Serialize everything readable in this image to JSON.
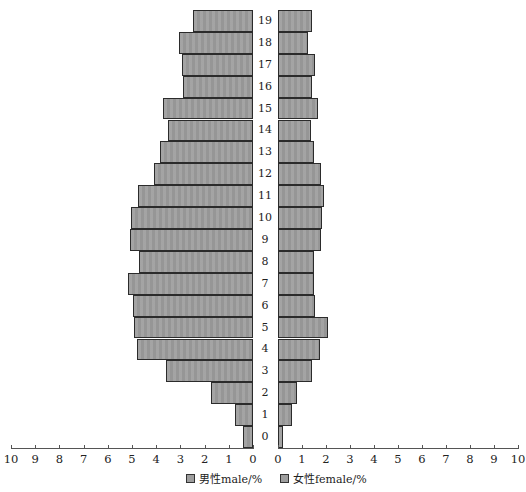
{
  "chart_data": {
    "type": "bar",
    "orientation": "horizontal",
    "subtype": "population-pyramid",
    "title": "",
    "categories": [
      "0",
      "1",
      "2",
      "3",
      "4",
      "5",
      "6",
      "7",
      "8",
      "9",
      "10",
      "11",
      "12",
      "13",
      "14",
      "15",
      "16",
      "17",
      "18",
      "19"
    ],
    "series": [
      {
        "name": "男性male/%",
        "side": "left",
        "color": "#9e9e9e",
        "values": [
          0.4,
          0.73,
          1.75,
          3.6,
          4.8,
          4.9,
          4.95,
          5.15,
          4.7,
          5.1,
          5.05,
          4.75,
          4.1,
          3.85,
          3.5,
          3.7,
          2.9,
          2.95,
          3.05,
          2.5
        ]
      },
      {
        "name": "女性female/%",
        "side": "right",
        "color": "#9e9e9e",
        "values": [
          0.2,
          0.59,
          0.78,
          1.43,
          1.76,
          2.1,
          1.56,
          1.48,
          1.48,
          1.78,
          1.84,
          1.91,
          1.78,
          1.48,
          1.38,
          1.66,
          1.43,
          1.56,
          1.26,
          1.43
        ]
      }
    ],
    "xlabel": "",
    "ylabel": "",
    "left_axis": {
      "ticks": [
        "10",
        "9",
        "8",
        "7",
        "6",
        "5",
        "4",
        "3",
        "2",
        "1",
        "0"
      ],
      "range": [
        10,
        0
      ]
    },
    "right_axis": {
      "ticks": [
        "0",
        "1",
        "2",
        "3",
        "4",
        "5",
        "6",
        "7",
        "8",
        "9",
        "10"
      ],
      "range": [
        0,
        10
      ]
    },
    "xlim": [
      0,
      10
    ],
    "grid": false,
    "legend_position": "bottom-center"
  },
  "legend": {
    "male": "男性male/%",
    "female": "女性female/%"
  }
}
